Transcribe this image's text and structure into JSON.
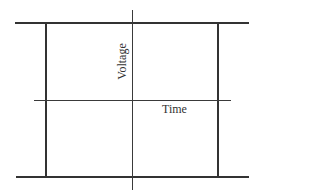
{
  "diagram": {
    "type": "voltage-time axes",
    "labels": {
      "y_axis": "Voltage",
      "x_axis": "Time"
    },
    "colors": {
      "line": "#333333",
      "background": "#ffffff"
    }
  }
}
